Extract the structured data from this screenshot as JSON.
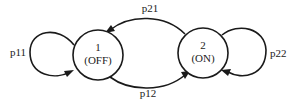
{
  "diagram": {
    "type": "state-transition",
    "states": [
      {
        "id": "1",
        "label": "1",
        "sublabel": "(OFF)"
      },
      {
        "id": "2",
        "label": "2",
        "sublabel": "(ON)"
      }
    ],
    "transitions": [
      {
        "from": "1",
        "to": "1",
        "label": "p11"
      },
      {
        "from": "1",
        "to": "2",
        "label": "p12"
      },
      {
        "from": "2",
        "to": "1",
        "label": "p21"
      },
      {
        "from": "2",
        "to": "2",
        "label": "p22"
      }
    ]
  }
}
